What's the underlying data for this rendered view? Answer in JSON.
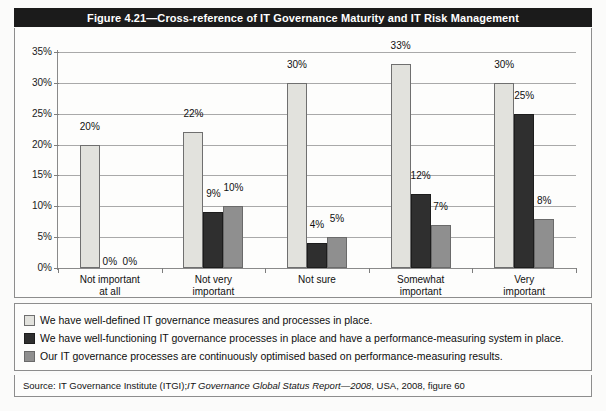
{
  "figure": {
    "title": "Figure 4.21—Cross-reference of IT Governance Maturity and IT Risk Management",
    "source_prefix": "Source:  IT Governance Institute (ITGI); ",
    "source_italic": "IT Governance Global Status Report—2008",
    "source_suffix": ", USA, 2008, figure 60"
  },
  "colors": {
    "series1": "#e2e2dd",
    "series2": "#2f2f2f",
    "series3": "#8f8f8f",
    "title_bar_bg": "#1b1b1b",
    "title_bar_text": "#ffffff",
    "gridline": "#a9a9a9",
    "panel_bg": "#fdfdfc"
  },
  "chart_data": {
    "type": "bar",
    "title": "Figure 4.21—Cross-reference of IT Governance Maturity and IT Risk Management",
    "subtitle": "",
    "xlabel": "",
    "ylabel": "",
    "grid": true,
    "legend_position": "bottom",
    "ylim": [
      0,
      35
    ],
    "ytick_labels": [
      "0%",
      "5%",
      "10%",
      "15%",
      "20%",
      "25%",
      "30%",
      "35%"
    ],
    "ytick_values": [
      0,
      5,
      10,
      15,
      20,
      25,
      30,
      35
    ],
    "categories": [
      "Not important\nat all",
      "Not very\nimportant",
      "Not sure",
      "Somewhat\nimportant",
      "Very important"
    ],
    "series": [
      {
        "name": "We have well-defined IT governance measures and processes in place.",
        "color": "#e2e2dd",
        "values": [
          20,
          22,
          30,
          33,
          30
        ],
        "labels": [
          "20%",
          "22%",
          "30%",
          "33%",
          "30%"
        ]
      },
      {
        "name": "We have well-functioning IT governance processes in place and have a performance-measuring system in place.",
        "color": "#2f2f2f",
        "values": [
          0,
          9,
          4,
          12,
          25
        ],
        "labels": [
          "0%",
          "9%",
          "4%",
          "12%",
          "25%"
        ]
      },
      {
        "name": "Our IT governance processes are continuously optimised based on performance-measuring results.",
        "color": "#8f8f8f",
        "values": [
          0,
          10,
          5,
          7,
          8
        ],
        "labels": [
          "0%",
          "10%",
          "5%",
          "7%",
          "8%"
        ]
      }
    ]
  },
  "legend": {
    "items": [
      "We have well-defined IT governance measures and processes in place.",
      "We have well-functioning IT governance processes in place and have a performance-measuring system in place.",
      "Our IT governance processes are continuously optimised based on performance-measuring results."
    ]
  }
}
